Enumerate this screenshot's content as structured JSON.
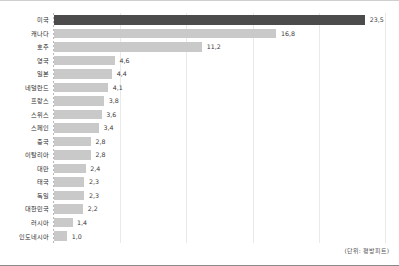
{
  "chart_data": {
    "type": "bar",
    "orientation": "horizontal",
    "title": "",
    "subtitle": "",
    "xlabel": "",
    "ylabel": "",
    "unit_note": "(단위: 평방피트)",
    "decimal_separator": ",",
    "grid": true,
    "gridlines_on": "x",
    "legend": null,
    "xlim": [
      0,
      25
    ],
    "xticks": [
      5,
      10,
      15,
      20,
      25
    ],
    "categories": [
      "미국",
      "캐나다",
      "호주",
      "영국",
      "일본",
      "네덜란드",
      "프랑스",
      "스위스",
      "스페인",
      "중국",
      "이탈리아",
      "대만",
      "태국",
      "독일",
      "대한민국",
      "러시아",
      "인도네시아"
    ],
    "values": [
      23.5,
      16.8,
      11.2,
      4.6,
      4.4,
      4.1,
      3.8,
      3.6,
      3.4,
      2.8,
      2.8,
      2.4,
      2.3,
      2.3,
      2.2,
      1.4,
      1.0
    ],
    "value_labels": [
      "23,5",
      "16,8",
      "11,2",
      "4,6",
      "4,4",
      "4,1",
      "3,8",
      "3,6",
      "3,4",
      "2,8",
      "2,8",
      "2,4",
      "2,3",
      "2,3",
      "2,2",
      "1,4",
      "1,0"
    ],
    "highlight_index": 0,
    "colors": {
      "bar": "#c9c9c9",
      "bar_highlight": "#4c4c4c",
      "gridline": "#e9e9e9",
      "axis": "#b9b9b9",
      "label_text": "#2b2b2b",
      "value_text": "#3a3a3a",
      "background": "#ffffff"
    }
  }
}
